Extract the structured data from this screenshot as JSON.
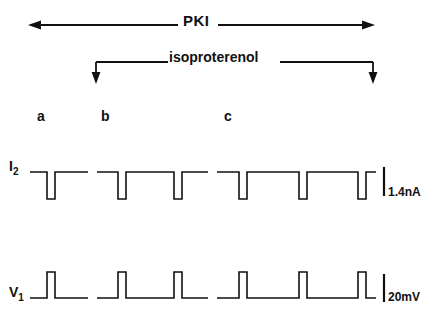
{
  "figure": {
    "title_bars": {
      "pki": {
        "label": "PKI",
        "arrow_style": "double-headed-horizontal",
        "y": 25,
        "x_start": 28,
        "x_end": 375
      },
      "isoproterenol": {
        "label": "isoproterenol",
        "arrow_style": "bracket-down-arrows",
        "y": 62,
        "x_start": 96,
        "x_end": 373,
        "drop_depth": 22
      }
    },
    "epoch_labels": [
      {
        "name": "a",
        "x": 37
      },
      {
        "name": "b",
        "x": 101
      },
      {
        "name": "c",
        "x": 224
      }
    ],
    "traces": [
      {
        "id": "I2",
        "label": "I",
        "label_sub": "2",
        "polarity": "downward",
        "baseline_y": 172,
        "pulse_amplitude_px": 27,
        "scale_bar": {
          "label": "1.4nA",
          "value": 1.4,
          "unit": "nA"
        }
      },
      {
        "id": "V1",
        "label": "V",
        "label_sub": "1",
        "polarity": "upward",
        "baseline_y": 298,
        "pulse_amplitude_px": 26,
        "scale_bar": {
          "label": "20mV",
          "value": 20,
          "unit": "mV"
        }
      }
    ],
    "colors": {
      "ink": "#111111",
      "background": "#ffffff"
    }
  },
  "chart_data": {
    "type": "line",
    "title": "",
    "xlabel": "",
    "ylabel": "",
    "grid": false,
    "legend": "none",
    "annotations": [
      {
        "text": "PKI",
        "type": "treatment-bar",
        "span": [
          28,
          375
        ]
      },
      {
        "text": "isoproterenol",
        "type": "treatment-bar",
        "span": [
          96,
          373
        ]
      },
      {
        "text": "a",
        "type": "epoch-marker",
        "x": 37
      },
      {
        "text": "b",
        "type": "epoch-marker",
        "x": 101
      },
      {
        "text": "c",
        "type": "epoch-marker",
        "x": 224
      }
    ],
    "segment_breaks": [
      [
        88,
        97
      ],
      [
        208,
        217
      ]
    ],
    "series": [
      {
        "name": "I2",
        "unit": "nA",
        "polarity": "negative",
        "scale_bar": 1.4,
        "baseline_y": 172,
        "pulses": [
          {
            "x_start": 47,
            "x_end": 55
          },
          {
            "x_start": 118,
            "x_end": 126
          },
          {
            "x_start": 174,
            "x_end": 182
          },
          {
            "x_start": 239,
            "x_end": 247
          },
          {
            "x_start": 299,
            "x_end": 307
          },
          {
            "x_start": 358,
            "x_end": 366
          }
        ],
        "trace_segments": [
          {
            "x_start": 30,
            "x_end": 88
          },
          {
            "x_start": 97,
            "x_end": 208
          },
          {
            "x_start": 217,
            "x_end": 376
          }
        ]
      },
      {
        "name": "V1",
        "unit": "mV",
        "polarity": "positive",
        "scale_bar": 20,
        "baseline_y": 298,
        "pulses": [
          {
            "x_start": 47,
            "x_end": 55
          },
          {
            "x_start": 118,
            "x_end": 126
          },
          {
            "x_start": 174,
            "x_end": 182
          },
          {
            "x_start": 239,
            "x_end": 247
          },
          {
            "x_start": 299,
            "x_end": 307
          },
          {
            "x_start": 358,
            "x_end": 366
          }
        ],
        "trace_segments": [
          {
            "x_start": 30,
            "x_end": 88
          },
          {
            "x_start": 97,
            "x_end": 208
          },
          {
            "x_start": 217,
            "x_end": 376
          }
        ]
      }
    ]
  }
}
